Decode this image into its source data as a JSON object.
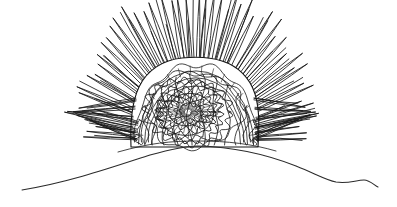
{
  "artwork": {
    "title": "Spiny sea urchin line drawing",
    "subject": "sea-urchin-on-horizon",
    "style": "black ink line art",
    "medium": "pen and ink illustration",
    "canvas": {
      "width": 397,
      "height": 207,
      "background_color": "#ffffff"
    },
    "ink_color": "#171717",
    "elements": [
      {
        "name": "horizon-line",
        "description": "gently arched ground line spanning the full width"
      },
      {
        "name": "urchin-body",
        "description": "domed shell rising above the horizon"
      },
      {
        "name": "spine-halo",
        "description": "radiating needle-like spines surrounding the shell"
      },
      {
        "name": "concentric-core",
        "description": "dense spiral rosette at the centre of the shell"
      }
    ]
  },
  "geometry": {
    "horizon": {
      "left_x": 22,
      "right_x": 378,
      "apex_x": 198,
      "apex_y": 146,
      "left_end_y": 190,
      "right_end_y": 186
    },
    "body": {
      "center_x": 196,
      "base_y": 146,
      "top_y": 60,
      "left_x": 131,
      "right_x": 258,
      "width": 127,
      "height": 86
    },
    "core": {
      "center_x": 188,
      "center_y": 112,
      "outer_radius": 30,
      "inner_radius": 4,
      "ring_count": 7,
      "spoke_count": 36
    },
    "spines": {
      "count": 58,
      "min_length": 26,
      "max_length": 86,
      "angle_start_deg": 182,
      "angle_end_deg": 358,
      "extent_left_x": 62,
      "extent_right_x": 303,
      "extent_top_y": 12
    },
    "contours": {
      "vertical_wave_count": 14,
      "scallop_band_count": 3
    }
  }
}
